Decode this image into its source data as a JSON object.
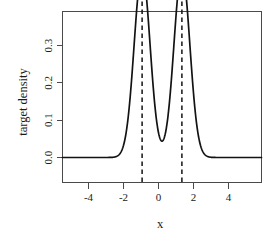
{
  "chart_data": {
    "type": "line",
    "title": "",
    "subtitle": "",
    "xlabel": "x",
    "ylabel": "target  density",
    "xlim": [
      -5,
      5
    ],
    "ylim": [
      0,
      0.385
    ],
    "grid": false,
    "legend": null,
    "xticks": [
      -4,
      -2,
      0,
      2,
      4
    ],
    "xtick_labels": [
      "-4",
      "-2",
      "0",
      "2",
      "4"
    ],
    "yticks": [
      0.0,
      0.1,
      0.2,
      0.3
    ],
    "ytick_labels": [
      "0.0",
      "0.1",
      "0.2",
      "0.3"
    ],
    "series": [
      {
        "name": "target density",
        "description": "Bimodal mixture density: 0.5*N(-1, 0.4^2) + 0.5*N(1, 0.4^2)",
        "style": "solid",
        "color": "#131313",
        "mixture": {
          "weights": [
            0.5,
            0.5
          ],
          "means": [
            -1,
            1
          ],
          "sds": [
            0.4,
            0.4
          ]
        },
        "x": [
          -5.0,
          -4.6,
          -4.2,
          -3.8,
          -3.4,
          -3.0,
          -2.8,
          -2.6,
          -2.4,
          -2.2,
          -2.0,
          -1.8,
          -1.6,
          -1.4,
          -1.2,
          -1.0,
          -0.8,
          -0.6,
          -0.4,
          -0.2,
          0.0,
          0.2,
          0.4,
          0.6,
          0.8,
          1.0,
          1.2,
          1.4,
          1.6,
          1.8,
          2.0,
          2.2,
          2.4,
          2.6,
          2.8,
          3.0,
          3.4,
          3.8,
          4.2,
          4.6,
          5.0
        ],
        "y": [
          0.0,
          0.0,
          0.0,
          0.0,
          0.0,
          0.001,
          0.002,
          0.006,
          0.016,
          0.036,
          0.072,
          0.13,
          0.2,
          0.29,
          0.352,
          0.374,
          0.352,
          0.29,
          0.2,
          0.13,
          0.072,
          0.13,
          0.2,
          0.29,
          0.352,
          0.374,
          0.352,
          0.29,
          0.2,
          0.13,
          0.072,
          0.036,
          0.016,
          0.006,
          0.002,
          0.001,
          0.0,
          0.0,
          0.0,
          0.0,
          0.0
        ],
        "peak_value": 0.374,
        "peak_x": [
          -1,
          1
        ],
        "valley_value": 0.072,
        "valley_x": 0
      }
    ],
    "annotations": [
      {
        "type": "vline",
        "x": -1,
        "style": "dashed",
        "color": "#131313"
      },
      {
        "type": "vline",
        "x": 1,
        "style": "dashed",
        "color": "#131313"
      }
    ]
  }
}
